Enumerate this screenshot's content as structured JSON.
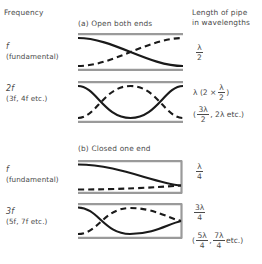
{
  "figure": {
    "headers": {
      "frequency": "Frequency",
      "length": "Length of pipe\nin wavelengths"
    },
    "sections": [
      {
        "id": "a",
        "label": "(a) Open both ends"
      },
      {
        "id": "b",
        "label": "(b) Closed one end"
      }
    ],
    "rows": [
      {
        "id": "open-fundamental",
        "freq_main": "f",
        "freq_sub": "(fundamental)",
        "pipe_type": "open-both-ends",
        "harmonic": 1,
        "length_primary": {
          "numerator": "λ",
          "denominator": "2"
        },
        "length_alt": ""
      },
      {
        "id": "open-second",
        "freq_main": "2f",
        "freq_sub": "(3f, 4f  etc.)",
        "pipe_type": "open-both-ends",
        "harmonic": 2,
        "length_primary_prefix": "λ (2 ×",
        "length_primary": {
          "numerator": "λ",
          "denominator": "2"
        },
        "length_primary_suffix": ")",
        "length_alt_open": "(",
        "length_alt_frac": {
          "numerator": "3λ",
          "denominator": "2"
        },
        "length_alt_tail": ", 2λ  etc.)"
      },
      {
        "id": "closed-fundamental",
        "freq_main": "f",
        "freq_sub": "(fundamental)",
        "pipe_type": "closed-one-end",
        "harmonic": 1,
        "length_primary": {
          "numerator": "λ",
          "denominator": "4"
        },
        "length_alt": ""
      },
      {
        "id": "closed-third",
        "freq_main": "3f",
        "freq_sub": "(5f, 7f etc.)",
        "pipe_type": "closed-one-end",
        "harmonic": 3,
        "length_primary": {
          "numerator": "3λ",
          "denominator": "4"
        },
        "length_alt_open": "(",
        "length_alt_frac": {
          "numerator": "5λ",
          "denominator": "4"
        },
        "length_alt_mid": ",",
        "length_alt_frac2": {
          "numerator": "7λ",
          "denominator": "4"
        },
        "length_alt_tail": "etc.)"
      }
    ],
    "colors": {
      "text": "#4a4a4a",
      "wall": "#9a9a9a",
      "curve": "#1a1a1a",
      "background": "#ffffff"
    }
  }
}
